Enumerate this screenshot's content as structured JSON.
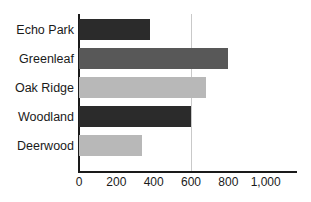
{
  "chart_data": {
    "type": "bar",
    "orientation": "horizontal",
    "title": "",
    "xlabel": "",
    "ylabel": "",
    "categories": [
      "Echo Park",
      "Greenleaf",
      "Oak Ridge",
      "Woodland",
      "Deerwood"
    ],
    "values": [
      380,
      800,
      680,
      600,
      340
    ],
    "bar_colors": [
      "#2b2b2b",
      "#585858",
      "#b8b8b8",
      "#2b2b2b",
      "#b8b8b8"
    ],
    "xlim": [
      0,
      1000
    ],
    "tick_values": [
      0,
      200,
      400,
      600,
      800,
      1000
    ],
    "tick_labels": [
      "0",
      "200",
      "400",
      "600",
      "800",
      "1,000"
    ],
    "gridlines": [
      600
    ],
    "grid": true,
    "legend": "none"
  },
  "axis": {
    "line_color": "#1a1a1a",
    "grid_color": "#c9c9c9"
  }
}
